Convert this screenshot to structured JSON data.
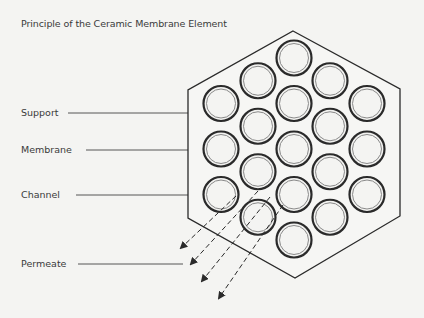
{
  "title": "Principle of the Ceramic Membrane Element",
  "labels": {
    "support": "Support",
    "membrane": "Membrane",
    "channel": "Channel",
    "permeate": "Permeate"
  },
  "element": {
    "shape": "hexagon",
    "channel_count": 19,
    "channel_columns": [
      3,
      4,
      5,
      4,
      3
    ],
    "permeate_arrow_count": 4
  },
  "colors": {
    "background": "#f4f4f2",
    "outline": "#2a2a2a",
    "membrane_ring": "#8a8a8a",
    "text": "#3a3a3a"
  }
}
